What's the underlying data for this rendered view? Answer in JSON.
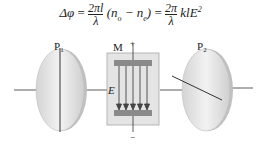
{
  "formula": {
    "lhs": "Δφ",
    "eq1": "=",
    "frac1_num": "2πl",
    "frac1_den": "λ",
    "paren": "(n",
    "sub_o": "o",
    "minus": " − n",
    "sub_e": "e",
    "close": ")",
    "eq2": "=",
    "frac2_num": "2π",
    "frac2_den": "λ",
    "tail": "klE",
    "sup": "2"
  },
  "labels": {
    "polarizer1": "P",
    "polarizer1_sub": "1",
    "polarizer2": "P",
    "polarizer2_sub": "2",
    "modulator": "M",
    "field": "E",
    "plus": "+",
    "minus": "−"
  },
  "colors": {
    "disk_fill": "#e6e6e6",
    "disk_edge": "#b8b8b8",
    "box_fill": "#e2e2e2",
    "box_edge": "#a0a0a0",
    "plate": "#8a8a8a",
    "line": "#333333"
  }
}
